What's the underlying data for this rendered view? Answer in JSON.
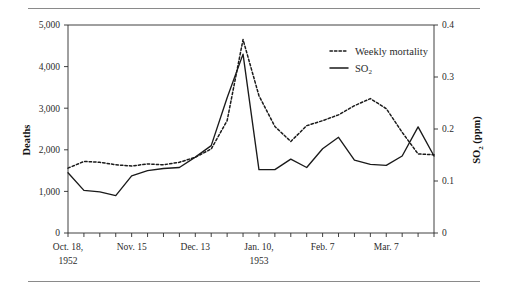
{
  "figure": {
    "name": "london-smog-mortality-so2-chart",
    "has_top_rule": true,
    "has_bottom_rule": true
  },
  "chart_data": {
    "type": "line",
    "title": "",
    "xlabel": "",
    "ylabel": "Deaths",
    "y2label": "SO2 (ppm)",
    "ylabel_display": "Deaths",
    "y2label_main": "SO",
    "y2label_sub": "2",
    "y2label_units": " (ppm)",
    "ylim": [
      0,
      5000
    ],
    "y2lim": [
      0,
      0.4
    ],
    "yticks": [
      0,
      1000,
      2000,
      3000,
      4000,
      5000
    ],
    "ytick_labels": [
      "0",
      "1,000",
      "2,000",
      "3,000",
      "4,000",
      "5,000"
    ],
    "y2ticks": [
      0,
      0.1,
      0.2,
      0.3,
      0.4
    ],
    "y2tick_labels": [
      "0",
      "0.1",
      "0.2",
      "0.3",
      "0.4"
    ],
    "grid": false,
    "legend_position": "top-right",
    "x_tick_count": 24,
    "x_labeled_ticks": [
      {
        "index": 0,
        "label": "Oct. 18,",
        "label2": "1952"
      },
      {
        "index": 4,
        "label": "Nov. 15",
        "label2": ""
      },
      {
        "index": 8,
        "label": "Dec. 13",
        "label2": ""
      },
      {
        "index": 12,
        "label": "Jan. 10,",
        "label2": "1953"
      },
      {
        "index": 16,
        "label": "Feb. 7",
        "label2": ""
      },
      {
        "index": 20,
        "label": "Mar. 7",
        "label2": ""
      }
    ],
    "x": [
      0,
      1,
      2,
      3,
      4,
      5,
      6,
      7,
      8,
      9,
      10,
      11,
      12,
      13,
      14,
      15,
      16,
      17,
      18,
      19,
      20,
      21,
      22,
      23
    ],
    "series": [
      {
        "name": "Weekly mortality",
        "key": "mortality",
        "style": "dotted",
        "axis": "left",
        "units": "deaths",
        "values": [
          1560,
          1720,
          1700,
          1640,
          1610,
          1660,
          1640,
          1700,
          1820,
          2020,
          2700,
          4650,
          3300,
          2560,
          2200,
          2580,
          2700,
          2840,
          3060,
          3230,
          2990,
          2420,
          1900,
          1880
        ]
      },
      {
        "name": "SO2",
        "key": "so2",
        "style": "solid",
        "axis": "right",
        "units": "ppm",
        "values_ppm": [
          0.116,
          0.082,
          0.079,
          0.072,
          0.11,
          0.12,
          0.124,
          0.126,
          0.146,
          0.168,
          0.26,
          0.344,
          0.122,
          0.122,
          0.142,
          0.126,
          0.162,
          0.184,
          0.14,
          0.132,
          0.13,
          0.148,
          0.204,
          0.148
        ]
      }
    ]
  },
  "legend": {
    "items": [
      {
        "label": "Weekly mortality",
        "style": "dotted"
      },
      {
        "label": "SO",
        "sub": "2",
        "style": "solid"
      }
    ]
  }
}
